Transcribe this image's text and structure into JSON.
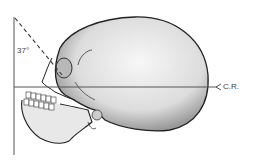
{
  "diagram": {
    "angle_label": "37°",
    "central_ray_label": "C.R.",
    "colors": {
      "line": "#555555",
      "skull_fill": "#e4e4e4",
      "skull_outline": "#222222",
      "background": "#ffffff"
    }
  }
}
